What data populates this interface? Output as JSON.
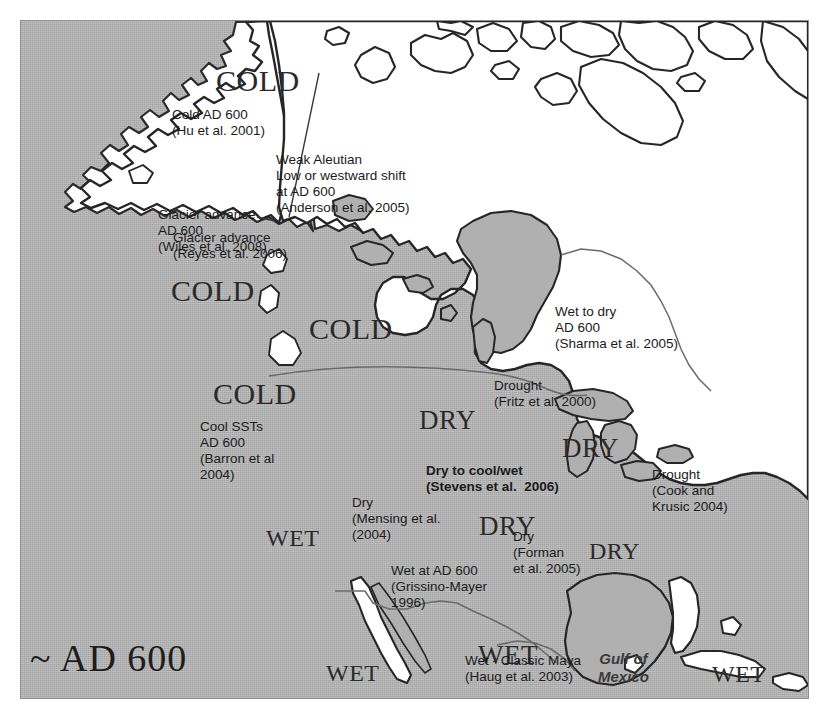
{
  "figure": {
    "era_label": "~ AD 600",
    "ocean_label_gulf": "Gulf of\nMexico",
    "frame_border_color": "#8d8d8d",
    "ocean_color": "#b0b0b0",
    "land_color": "#ffffff",
    "lake_color": "#b0b0b0",
    "text_color": "#1b1b1b"
  },
  "climate_labels": [
    {
      "id": "cold-alaska-north",
      "text": "COLD"
    },
    {
      "id": "cold-gulf-alaska",
      "text": "COLD"
    },
    {
      "id": "cold-bc",
      "text": "COLD"
    },
    {
      "id": "cold-pnw",
      "text": "COLD"
    },
    {
      "id": "dry-northern-plains",
      "text": "DRY"
    },
    {
      "id": "dry-upper-midwest",
      "text": "DRY"
    },
    {
      "id": "dry-great-basin",
      "text": "DRY"
    },
    {
      "id": "dry-southern-plains",
      "text": "DRY"
    },
    {
      "id": "wet-california",
      "text": "WET"
    },
    {
      "id": "wet-baja",
      "text": "WET"
    },
    {
      "id": "wet-maya",
      "text": "WET"
    },
    {
      "id": "wet-caribbean",
      "text": "WET"
    }
  ],
  "citations": [
    {
      "id": "hu-2001",
      "lines": "Cold AD 600\n(Hu et al. 2001)"
    },
    {
      "id": "anderson-2005",
      "lines": "Weak Aleutian\nLow or westward shift\nat AD 600\n(Anderson et al. 2005)"
    },
    {
      "id": "wiles-2008",
      "lines": "Glacier advance\nAD 600\n(Wiles et al. 2008)"
    },
    {
      "id": "reyes-2006",
      "lines": "Glacier advance\n(Reyes et al. 2006)"
    },
    {
      "id": "sharma-2005",
      "lines": "Wet to dry\nAD 600\n(Sharma et al. 2005)"
    },
    {
      "id": "fritz-2000",
      "lines": "Drought\n(Fritz et al. 2000)"
    },
    {
      "id": "barron-2004",
      "lines": "Cool SSTs\nAD 600\n(Barron et al\n2004)"
    },
    {
      "id": "stevens-2006",
      "lines": "Dry to cool/wet\n(Stevens et al.  2006)"
    },
    {
      "id": "cook-krusic-2004",
      "lines": "Drought\n(Cook and\nKrusic 2004)"
    },
    {
      "id": "mensing-2004",
      "lines": "Dry\n(Mensing et al.\n(2004)"
    },
    {
      "id": "forman-2005",
      "lines": "Dry\n(Forman\net al. 2005)"
    },
    {
      "id": "grissino-mayer-1996",
      "lines": "Wet at AD 600\n(Grissino-Mayer\n1996)"
    },
    {
      "id": "haug-2003",
      "lines": "Wet - Classic Maya\n(Haug et al. 2003)"
    }
  ]
}
